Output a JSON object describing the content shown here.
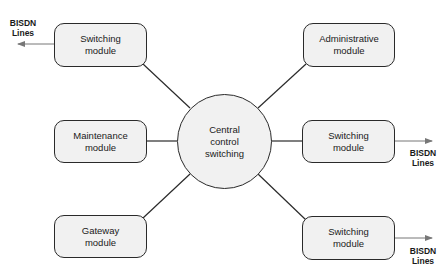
{
  "diagram": {
    "center": {
      "line1": "Central",
      "line2": "control",
      "line3": "switching"
    },
    "modules": [
      {
        "id": "switching-top-left",
        "line1": "Switching",
        "line2": "module"
      },
      {
        "id": "administrative",
        "line1": "Administrative",
        "line2": "module"
      },
      {
        "id": "maintenance",
        "line1": "Maintenance",
        "line2": "module"
      },
      {
        "id": "switching-middle-right",
        "line1": "Switching",
        "line2": "module"
      },
      {
        "id": "gateway",
        "line1": "Gateway",
        "line2": "module"
      },
      {
        "id": "switching-bottom-right",
        "line1": "Switching",
        "line2": "module"
      }
    ],
    "external_labels": [
      {
        "line1": "BISDN",
        "line2": "Lines"
      },
      {
        "line1": "BISDN",
        "line2": "Lines"
      },
      {
        "line1": "BISDN",
        "line2": "Lines"
      }
    ],
    "colors": {
      "stroke": "#2a2a2a",
      "fill": "#f1f1f1",
      "arrow": "#777777"
    }
  }
}
